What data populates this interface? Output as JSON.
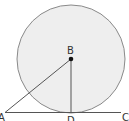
{
  "diagram": {
    "type": "geometry",
    "colors": {
      "circle_fill": "#eeeeee",
      "circle_stroke": "#8a8a8a",
      "line_stroke": "#555555",
      "point_fill": "#111111",
      "label": "#333333"
    },
    "circle": {
      "center": "B",
      "cx": 71,
      "cy": 59,
      "r": 54
    },
    "points": {
      "A": {
        "label": "A",
        "x": 5,
        "y": 112
      },
      "B": {
        "label": "B",
        "x": 71,
        "y": 59
      },
      "C": {
        "label": "C",
        "x": 121,
        "y": 112
      },
      "D": {
        "label": "D",
        "x": 71,
        "y": 112
      }
    },
    "segments": [
      {
        "from": "A",
        "to": "C"
      },
      {
        "from": "B",
        "to": "A"
      },
      {
        "from": "B",
        "to": "D"
      }
    ]
  }
}
